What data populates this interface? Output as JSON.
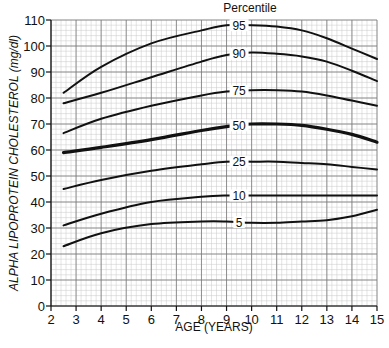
{
  "chart_data": {
    "type": "line",
    "title": "",
    "legend_title": "Percentile",
    "xlabel": "AGE (YEARS)",
    "ylabel": "ALPHA LIPOPROTEIN CHOLESTEROL (mg/dl)",
    "xlim": [
      2,
      15
    ],
    "ylim": [
      0,
      110
    ],
    "xticks": [
      2,
      3,
      4,
      5,
      6,
      7,
      8,
      9,
      10,
      11,
      12,
      13,
      14,
      15
    ],
    "yticks": [
      0,
      10,
      20,
      30,
      40,
      50,
      60,
      70,
      80,
      90,
      100,
      110
    ],
    "grid": true,
    "label_position": "inline at age 9.5",
    "x": [
      2.5,
      4,
      6,
      8,
      9,
      10,
      11,
      12,
      13,
      14,
      15
    ],
    "series": [
      {
        "name": "95",
        "values": [
          82,
          92,
          101,
          106,
          108,
          108,
          107.5,
          106,
          103,
          99,
          95
        ]
      },
      {
        "name": "90",
        "values": [
          78,
          82,
          88,
          94,
          96.5,
          97.5,
          97,
          96,
          94,
          90.5,
          86.5
        ]
      },
      {
        "name": "75",
        "values": [
          66.5,
          72,
          77,
          81,
          82.5,
          83,
          83,
          82.5,
          81,
          79,
          77
        ]
      },
      {
        "name": "50",
        "values": [
          59,
          61,
          64,
          67.5,
          69,
          70,
          70,
          69.5,
          68,
          66,
          63
        ],
        "emphasis": true
      },
      {
        "name": "25",
        "values": [
          45,
          48.5,
          52,
          54.5,
          55.5,
          55.5,
          55.5,
          55,
          54.5,
          53.5,
          52.5
        ]
      },
      {
        "name": "10",
        "values": [
          31,
          35.5,
          40,
          42,
          42.5,
          42.5,
          42.5,
          42.5,
          42.5,
          42.5,
          42.5
        ]
      },
      {
        "name": "5",
        "values": [
          23,
          28,
          31.5,
          32.5,
          32.5,
          32,
          32,
          32.5,
          33,
          34.5,
          37
        ]
      }
    ]
  }
}
